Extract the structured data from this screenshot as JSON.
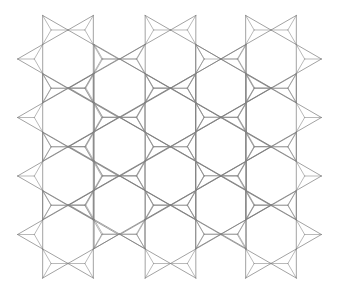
{
  "image": {
    "description": "Geometric line-art tiling of hexagons with triangular star points (hexagram pattern)",
    "width": 338,
    "height": 295,
    "background": "#ffffff",
    "line_color": "#7a7a7a"
  },
  "pattern": {
    "hex_radius": 29,
    "hex_half_width": 25.3,
    "hexagons": [
      {
        "cx": 68,
        "cy": 59
      },
      {
        "cx": 68,
        "cy": 117.5
      },
      {
        "cx": 68,
        "cy": 176
      },
      {
        "cx": 68,
        "cy": 234.5
      },
      {
        "cx": 170.5,
        "cy": 59
      },
      {
        "cx": 170.5,
        "cy": 117.5
      },
      {
        "cx": 170.5,
        "cy": 176
      },
      {
        "cx": 170.5,
        "cy": 234.5
      },
      {
        "cx": 271,
        "cy": 59
      },
      {
        "cx": 271,
        "cy": 117.5
      },
      {
        "cx": 271,
        "cy": 176
      },
      {
        "cx": 271,
        "cy": 234.5
      },
      {
        "cx": 119.5,
        "cy": 88
      },
      {
        "cx": 119.5,
        "cy": 146.5
      },
      {
        "cx": 119.5,
        "cy": 205
      },
      {
        "cx": 221,
        "cy": 88
      },
      {
        "cx": 221,
        "cy": 146.5
      },
      {
        "cx": 221,
        "cy": 205
      }
    ]
  }
}
